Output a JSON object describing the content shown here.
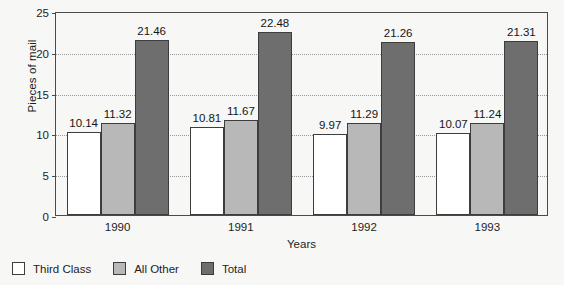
{
  "chart_data": {
    "type": "bar",
    "title": "",
    "xlabel": "Years",
    "ylabel": "Pieces of mail",
    "categories": [
      "1990",
      "1991",
      "1992",
      "1993"
    ],
    "series": [
      {
        "name": "Third Class",
        "color": "#ffffff",
        "values": [
          10.14,
          10.81,
          9.97,
          10.07
        ]
      },
      {
        "name": "All Other",
        "color": "#b8b8b8",
        "values": [
          11.32,
          11.67,
          11.29,
          11.24
        ]
      },
      {
        "name": "Total",
        "color": "#6e6e6e",
        "values": [
          21.46,
          22.48,
          21.26,
          21.31
        ]
      }
    ],
    "ylim": [
      0,
      25
    ],
    "yticks": [
      "0",
      "5",
      "10",
      "15",
      "20",
      "25"
    ],
    "ytick_values": [
      0,
      5,
      10,
      15,
      20,
      25
    ],
    "grid": "horizontal-dotted",
    "legend_position": "below-left",
    "data_labels": true
  },
  "legend": {
    "items": [
      {
        "label": "Third Class",
        "swatch": "third"
      },
      {
        "label": "All Other",
        "swatch": "other"
      },
      {
        "label": "Total",
        "swatch": "total"
      }
    ]
  }
}
